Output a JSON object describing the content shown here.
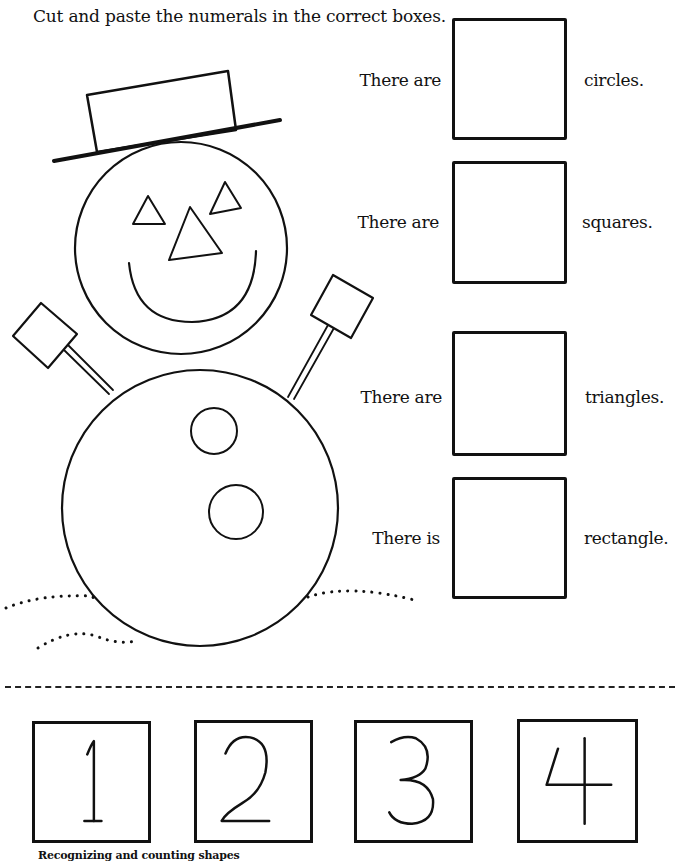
{
  "worksheet": {
    "instruction": "Cut and paste the numerals in the correct boxes.",
    "caption": "Recognizing and counting shapes"
  },
  "illustration": {
    "subject": "snowman",
    "shapes": {
      "circles": 4,
      "squares": 2,
      "triangles": 3,
      "rectangles": 1
    }
  },
  "questions": [
    {
      "prefix": "There are",
      "suffix": "circles.",
      "answer": ""
    },
    {
      "prefix": "There are",
      "suffix": "squares.",
      "answer": ""
    },
    {
      "prefix": "There are",
      "suffix": "triangles.",
      "answer": ""
    },
    {
      "prefix": "There is",
      "suffix": "rectangle.",
      "answer": ""
    }
  ],
  "numeral_cards": [
    {
      "label": "1"
    },
    {
      "label": "2"
    },
    {
      "label": "3"
    },
    {
      "label": "4"
    }
  ],
  "colors": {
    "ink": "#111111",
    "paper": "#ffffff"
  }
}
